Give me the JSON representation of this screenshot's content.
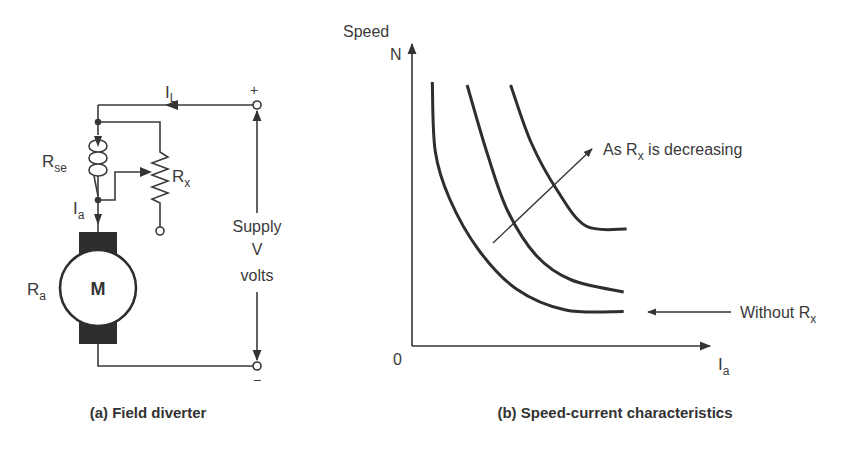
{
  "figure_a": {
    "caption": "(a) Field diverter",
    "labels": {
      "load_current": "I",
      "load_current_sub": "L",
      "series_field": "R",
      "series_field_sub": "se",
      "diverter": "R",
      "diverter_sub": "x",
      "armature_current": "I",
      "armature_current_sub": "a",
      "armature_resistance": "R",
      "armature_resistance_sub": "a",
      "motor": "M",
      "plus": "+",
      "minus": "−",
      "supply_line1": "Supply",
      "supply_line2": "V",
      "supply_line3": "volts"
    }
  },
  "figure_b": {
    "caption": "(b) Speed-current characteristics",
    "y_label_line1": "Speed",
    "y_label_line2": "N",
    "x_label": "I",
    "x_label_sub": "a",
    "origin": "0",
    "annotation_decreasing": "As R",
    "annotation_decreasing_sub": "x",
    "annotation_decreasing_tail": " is decreasing",
    "annotation_without": "Without R",
    "annotation_without_sub": "x"
  },
  "chart_data": {
    "type": "line",
    "title": "(b) Speed-current characteristics",
    "xlabel": "Ia",
    "ylabel": "Speed N",
    "xlim": [
      0,
      10
    ],
    "ylim": [
      0,
      10
    ],
    "grid": false,
    "series": [
      {
        "name": "Without Rx",
        "x": [
          0.7,
          0.8,
          1.3,
          2.3,
          3.6,
          5.3,
          7.3
        ],
        "y": [
          8.8,
          6.5,
          4.9,
          3.2,
          1.9,
          1.2,
          1.15
        ]
      },
      {
        "name": "Rx (higher)",
        "x": [
          1.9,
          2.6,
          3.3,
          4.3,
          5.5,
          7.3
        ],
        "y": [
          8.7,
          6.4,
          4.5,
          3.0,
          2.2,
          1.8
        ]
      },
      {
        "name": "Rx (lower)",
        "x": [
          3.4,
          4.1,
          5.0,
          6.0,
          7.4
        ],
        "y": [
          8.7,
          6.8,
          5.2,
          4.0,
          3.9
        ]
      }
    ],
    "annotations": [
      "As Rx is decreasing",
      "Without Rx"
    ]
  }
}
